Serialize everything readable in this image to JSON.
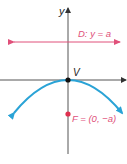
{
  "diagram": {
    "type": "parabola-definition",
    "axes": {
      "y_label": "y",
      "x_label": "x"
    },
    "directrix": {
      "label": "D: y = a",
      "color": "#e0507a"
    },
    "vertex": {
      "label": "V",
      "color": "#222222"
    },
    "focus": {
      "label": "F = (0, −a)",
      "color": "#e0304f"
    },
    "parabola": {
      "color": "#2aa3d6",
      "opens": "down"
    },
    "axis_color": "#555555"
  }
}
